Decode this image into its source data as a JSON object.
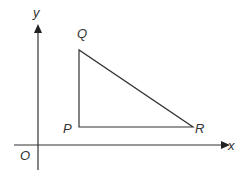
{
  "diagram": {
    "type": "coordinate-geometry",
    "axes": {
      "x_label": "x",
      "y_label": "y",
      "origin_label": "O"
    },
    "points": {
      "P": {
        "label": "P"
      },
      "Q": {
        "label": "Q"
      },
      "R": {
        "label": "R"
      }
    },
    "colors": {
      "line": "#333333",
      "background": "#ffffff"
    }
  }
}
